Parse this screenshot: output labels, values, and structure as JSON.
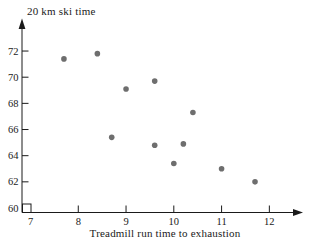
{
  "figure": {
    "y_axis_title": "20 km ski time",
    "x_axis_title": "Treadmill run time to exhaustion"
  },
  "chart_data": {
    "type": "scatter",
    "title": "",
    "xlabel": "Treadmill run time to exhaustion",
    "ylabel": "20 km ski time",
    "points": [
      {
        "x": 7.7,
        "y": 71.4
      },
      {
        "x": 8.4,
        "y": 71.8
      },
      {
        "x": 8.7,
        "y": 65.4
      },
      {
        "x": 9.0,
        "y": 69.1
      },
      {
        "x": 9.6,
        "y": 69.7
      },
      {
        "x": 9.6,
        "y": 64.8
      },
      {
        "x": 10.0,
        "y": 63.4
      },
      {
        "x": 10.2,
        "y": 64.9
      },
      {
        "x": 10.4,
        "y": 67.3
      },
      {
        "x": 11.0,
        "y": 63.0
      },
      {
        "x": 11.7,
        "y": 62.0
      }
    ],
    "x_ticks": [
      7,
      8,
      9,
      10,
      11,
      12
    ],
    "y_ticks": [
      60,
      62,
      64,
      66,
      68,
      70,
      72
    ],
    "xlim": [
      7,
      12.6
    ],
    "ylim": [
      59.6,
      73
    ],
    "grid": false,
    "legend": null,
    "marker_color": "#6e6e6e",
    "axis_color": "#1a1a1a",
    "axis_break_box": true
  }
}
